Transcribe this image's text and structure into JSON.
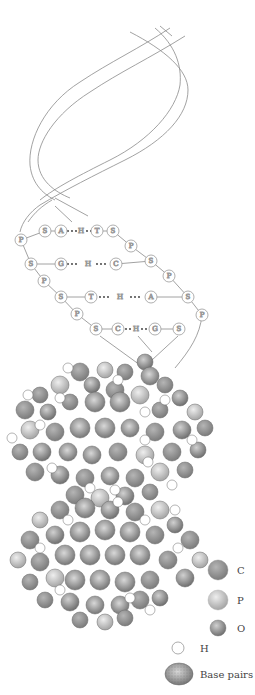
{
  "diagram": {
    "ladder": {
      "rows": [
        {
          "left_sugar": "S",
          "base_left": "A",
          "bond": "H",
          "base_right": "T",
          "right_sugar": "S"
        },
        {
          "left_sugar": "S",
          "base_left": "G",
          "bond": "H",
          "base_right": "C",
          "right_sugar": "S"
        },
        {
          "left_sugar": "S",
          "base_left": "T",
          "bond": "H",
          "base_right": "A",
          "right_sugar": "S"
        },
        {
          "left_sugar": "S",
          "base_left": "C",
          "bond": "H",
          "base_right": "G",
          "right_sugar": "S"
        }
      ],
      "phosphate_label": "P",
      "sugar_label": "S"
    },
    "legend": {
      "items": [
        {
          "key": "C",
          "label": "C",
          "color": "#8c8c8c",
          "style": "solid"
        },
        {
          "key": "P",
          "label": "P",
          "color": "#c4c4c4",
          "style": "light-shaded"
        },
        {
          "key": "O",
          "label": "O",
          "color": "#9a9a9a",
          "style": "shaded-small"
        },
        {
          "key": "H",
          "label": "H",
          "color": "#ffffff",
          "style": "outline"
        },
        {
          "key": "base_pairs",
          "label": "Base pairs",
          "color": "#a0a0a0",
          "style": "stippled"
        }
      ]
    },
    "colors": {
      "line": "#8a8a8a",
      "node_stroke": "#9a9a9a",
      "node_fill": "#ffffff",
      "atom_dark": "#8c8c8c",
      "atom_mid": "#a8a8a8",
      "atom_light": "#c8c8c8"
    }
  }
}
